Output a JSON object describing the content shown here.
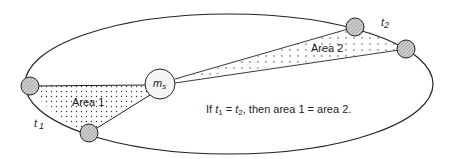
{
  "diagram": {
    "sun": {
      "label_main": "m",
      "label_sub": "s"
    },
    "area1": {
      "label": "Area 1"
    },
    "area2": {
      "label": "Area 2"
    },
    "t1": {
      "label_main": "t",
      "label_sub": "1"
    },
    "t2": {
      "label_main": "t",
      "label_sub": "2"
    },
    "statement": {
      "prefix": "If ",
      "t1_main": "t",
      "t1_sub": "1",
      "eq": " = ",
      "t2_main": "t",
      "t2_sub": "2",
      "suffix": ", then area 1 = area 2."
    },
    "colors": {
      "line": "#222222",
      "planet_fill": "#b8b8b8",
      "sun_fill": "#f4f4f4",
      "dot": "#333333"
    }
  }
}
